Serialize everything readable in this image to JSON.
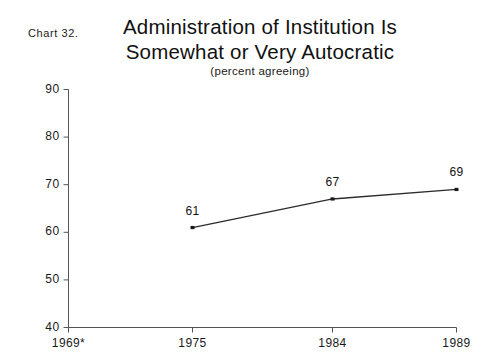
{
  "chart_number": "Chart 32.",
  "chart_data": {
    "type": "line",
    "title": "Administration of Institution Is Somewhat or Very Autocratic",
    "title_line1": "Administration of Institution Is",
    "title_line2": "Somewhat or Very Autocratic",
    "subtitle": "(percent agreeing)",
    "xlabel": "",
    "ylabel": "",
    "categories": [
      "1969*",
      "1975",
      "1984",
      "1989"
    ],
    "x_tick_labels": [
      "1969*",
      "1975",
      "1984",
      "1989"
    ],
    "values": [
      null,
      61,
      67,
      69
    ],
    "point_labels": [
      "",
      "61",
      "67",
      "69"
    ],
    "y_tick_labels": [
      "90",
      "80",
      "70",
      "60",
      "50",
      "40"
    ],
    "y_ticks": [
      90,
      80,
      70,
      60,
      50,
      40
    ],
    "ylim": [
      40,
      90
    ],
    "grid": "none",
    "legend": "none",
    "series": [
      {
        "name": "percent agreeing",
        "x": [
          "1975",
          "1984",
          "1989"
        ],
        "values": [
          61,
          67,
          69
        ]
      }
    ],
    "footnote_marker": "*",
    "line_color": "#2b2b2b",
    "marker_color": "#1a1a1a",
    "axis_color": "#555555",
    "background_color": "#ffffff"
  }
}
